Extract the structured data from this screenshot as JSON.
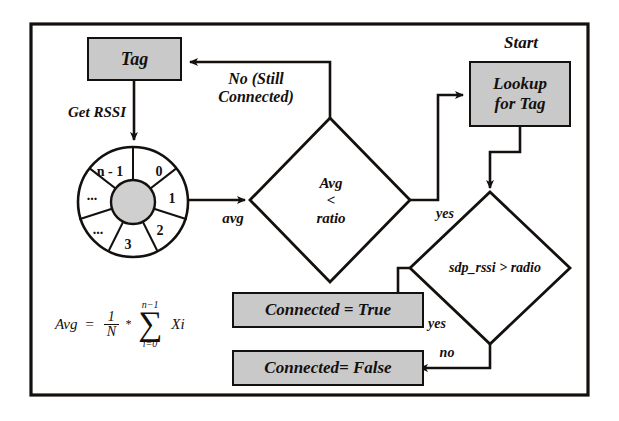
{
  "diagram": {
    "colors": {
      "node_fill": "#c9c9c9",
      "stroke": "#14100e",
      "background": "#ffffff",
      "hub_fill": "#cfcfcf"
    },
    "border": {
      "label": "diagram-frame"
    },
    "nodes": {
      "tag": {
        "label": "Tag",
        "shape": "process"
      },
      "lookup": {
        "label": "Lookup\nfor Tag",
        "shape": "process"
      },
      "connected_true": {
        "label": "Connected = True",
        "shape": "process"
      },
      "connected_false": {
        "label": "Connected= False",
        "shape": "process"
      },
      "decision_avg": {
        "label": "Avg\n<\nratio",
        "shape": "decision"
      },
      "decision_rssi": {
        "label": "sdp_rssi > radio",
        "shape": "decision"
      }
    },
    "annotations": {
      "start": "Start",
      "get_rssi": "Get RSSI",
      "no_still_connected": "No (Still\nConnected)",
      "avg_edge": "avg",
      "yes_avg": "yes",
      "yes_rssi": "yes",
      "no_rssi": "no"
    },
    "buffer": {
      "name": "circular-rssi-buffer",
      "segments": [
        "0",
        "1",
        "2",
        "3",
        "...",
        "...",
        "n - 1"
      ]
    },
    "formula": {
      "lhs": "Avg",
      "equals": "=",
      "numerator": "1",
      "denominator": "N",
      "times": "*",
      "sigma_upper": "n−1",
      "sigma_symbol": "∑",
      "sigma_lower": "i=0",
      "term": "Xi",
      "plain": "Avg = (1/N) * ∑(i=0 to n-1) Xi"
    }
  }
}
